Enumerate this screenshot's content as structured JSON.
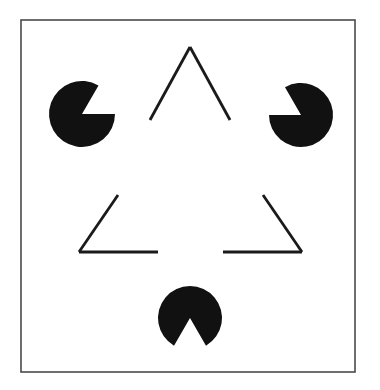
{
  "figure": {
    "canvas": {
      "width": 380,
      "height": 390,
      "background": "#ffffff"
    },
    "colors": {
      "ink": "#1a1a1a",
      "disc_fill": "#111111",
      "frame_stroke": "#4a4a4a",
      "background": "#ffffff"
    },
    "frame": {
      "label": "figure-border",
      "x": 21,
      "y": 20,
      "width": 334,
      "height": 352,
      "stroke_width": 1.6
    },
    "outline_triangle": {
      "label": "outline-triangle",
      "stroke_width": 2.8,
      "vertices": [
        {
          "name": "apex",
          "x": 190,
          "y": 47
        },
        {
          "name": "bottom-left",
          "x": 79,
          "y": 252
        },
        {
          "name": "bottom-right",
          "x": 302,
          "y": 252
        }
      ],
      "segments": [
        {
          "name": "apex-left-arm",
          "x1": 190,
          "y1": 47,
          "x2": 150,
          "y2": 120
        },
        {
          "name": "apex-right-arm",
          "x1": 190,
          "y1": 47,
          "x2": 230,
          "y2": 120
        },
        {
          "name": "left-upper-arm",
          "x1": 118,
          "y1": 195,
          "x2": 79,
          "y2": 252
        },
        {
          "name": "left-base-arm",
          "x1": 79,
          "y1": 252,
          "x2": 158,
          "y2": 252
        },
        {
          "name": "right-upper-arm",
          "x1": 263,
          "y1": 195,
          "x2": 302,
          "y2": 252
        },
        {
          "name": "right-base-arm",
          "x1": 302,
          "y1": 252,
          "x2": 223,
          "y2": 252
        }
      ]
    },
    "discs": [
      {
        "name": "pacman-top-left",
        "position": "top-left",
        "cx": 82,
        "cy": 114,
        "r": 33,
        "wedge_center_angle_deg": 30,
        "wedge_span_deg": 60,
        "notch_points_toward": "illusory-triangle-top-left-vertex"
      },
      {
        "name": "pacman-top-right",
        "position": "top-right",
        "cx": 301,
        "cy": 115,
        "r": 32,
        "wedge_center_angle_deg": 150,
        "wedge_span_deg": 60,
        "notch_points_toward": "illusory-triangle-top-right-vertex"
      },
      {
        "name": "pacman-bottom",
        "position": "bottom-center",
        "cx": 190,
        "cy": 318,
        "r": 32,
        "wedge_center_angle_deg": 270,
        "wedge_span_deg": 60,
        "notch_points_toward": "illusory-triangle-bottom-vertex"
      }
    ],
    "illusory_triangle": {
      "label": "illusory-triangle",
      "description": "perceived white triangle, no drawn edges",
      "vertices": [
        {
          "name": "top",
          "x": 190,
          "y": 286
        },
        {
          "name": "left",
          "x": 110,
          "y": 146
        },
        {
          "name": "right",
          "x": 270,
          "y": 146
        }
      ]
    }
  }
}
